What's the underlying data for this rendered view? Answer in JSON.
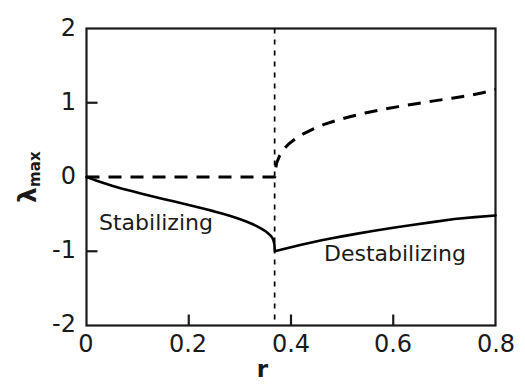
{
  "chart_data": {
    "type": "line",
    "title": "",
    "subtitle": "",
    "xlabel": "r",
    "ylabel": "λ",
    "ylabel_sub": "max",
    "xlim": [
      0,
      0.8
    ],
    "ylim": [
      -2,
      2
    ],
    "xticks": [
      0,
      0.2,
      0.4,
      0.6,
      0.8
    ],
    "xtick_labels": [
      "0",
      "0.2",
      "0.4",
      "0.6",
      "0.8"
    ],
    "yticks": [
      -2,
      -1,
      0,
      1,
      2
    ],
    "ytick_labels": [
      "-2",
      "-1",
      "0",
      "1",
      "2"
    ],
    "grid": false,
    "legend": "none",
    "tick_direction": "in",
    "frame": "box",
    "axis_color": "#1a1a1a",
    "line_color": "#000000",
    "background": "#ffffff",
    "critical_r": 0.368,
    "annotations": [
      {
        "name": "stabilizing",
        "text": "Stabilizing",
        "r": 0.12,
        "lambda": -0.7
      },
      {
        "name": "destabilizing",
        "text": "Destabilizing",
        "r": 0.565,
        "lambda": -1.12
      }
    ],
    "vline": {
      "x": 0.368,
      "style": "dashed",
      "from": -2,
      "to": 2
    },
    "series": [
      {
        "name": "solid-branch",
        "style": "solid",
        "width": 2.6,
        "points": [
          [
            0.0,
            0.0
          ],
          [
            0.01,
            -0.025
          ],
          [
            0.02,
            -0.05
          ],
          [
            0.035,
            -0.085
          ],
          [
            0.05,
            -0.118
          ],
          [
            0.07,
            -0.157
          ],
          [
            0.09,
            -0.193
          ],
          [
            0.11,
            -0.228
          ],
          [
            0.13,
            -0.262
          ],
          [
            0.15,
            -0.295
          ],
          [
            0.17,
            -0.328
          ],
          [
            0.19,
            -0.361
          ],
          [
            0.21,
            -0.394
          ],
          [
            0.23,
            -0.428
          ],
          [
            0.25,
            -0.463
          ],
          [
            0.265,
            -0.492
          ],
          [
            0.28,
            -0.522
          ],
          [
            0.295,
            -0.555
          ],
          [
            0.31,
            -0.592
          ],
          [
            0.322,
            -0.626
          ],
          [
            0.332,
            -0.658
          ],
          [
            0.341,
            -0.691
          ],
          [
            0.349,
            -0.725
          ],
          [
            0.355,
            -0.757
          ],
          [
            0.36,
            -0.789
          ],
          [
            0.364,
            -0.825
          ],
          [
            0.366,
            -0.86
          ],
          [
            0.3675,
            -0.905
          ],
          [
            0.368,
            -0.96
          ],
          [
            0.3683,
            -1.0
          ],
          [
            0.38,
            -0.98
          ],
          [
            0.4,
            -0.945
          ],
          [
            0.42,
            -0.912
          ],
          [
            0.44,
            -0.882
          ],
          [
            0.46,
            -0.853
          ],
          [
            0.48,
            -0.826
          ],
          [
            0.5,
            -0.8
          ],
          [
            0.53,
            -0.763
          ],
          [
            0.56,
            -0.728
          ],
          [
            0.6,
            -0.684
          ],
          [
            0.64,
            -0.643
          ],
          [
            0.68,
            -0.604
          ],
          [
            0.72,
            -0.566
          ],
          [
            0.76,
            -0.54
          ],
          [
            0.8,
            -0.518
          ]
        ]
      },
      {
        "name": "dashed-branch",
        "style": "dashed",
        "width": 3.0,
        "dash_pattern": "13,9",
        "points": [
          [
            0.0,
            0.0
          ],
          [
            0.05,
            0.0
          ],
          [
            0.1,
            0.0
          ],
          [
            0.15,
            0.0
          ],
          [
            0.2,
            0.0
          ],
          [
            0.25,
            0.0
          ],
          [
            0.3,
            0.0
          ],
          [
            0.34,
            0.0
          ],
          [
            0.365,
            0.0
          ],
          [
            0.3683,
            0.0
          ],
          [
            0.3683,
            0.06
          ],
          [
            0.372,
            0.19
          ],
          [
            0.378,
            0.29
          ],
          [
            0.386,
            0.375
          ],
          [
            0.396,
            0.448
          ],
          [
            0.41,
            0.52
          ],
          [
            0.425,
            0.585
          ],
          [
            0.445,
            0.652
          ],
          [
            0.465,
            0.708
          ],
          [
            0.49,
            0.765
          ],
          [
            0.515,
            0.812
          ],
          [
            0.545,
            0.862
          ],
          [
            0.575,
            0.905
          ],
          [
            0.61,
            0.948
          ],
          [
            0.645,
            0.987
          ],
          [
            0.68,
            1.025
          ],
          [
            0.715,
            1.062
          ],
          [
            0.75,
            1.1
          ],
          [
            0.775,
            1.135
          ],
          [
            0.8,
            1.18
          ]
        ]
      }
    ]
  }
}
